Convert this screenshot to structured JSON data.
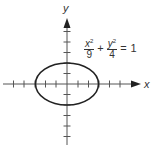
{
  "figure": {
    "axes": {
      "x_label": "x",
      "y_label": "y",
      "origin_px": [
        67,
        84
      ],
      "tick_spacing_px": 10.5,
      "x_ticks_count_each_side": 6,
      "y_ticks_count_up": 6,
      "y_ticks_count_down": 6
    },
    "curve": {
      "type": "ellipse",
      "semi_major_x": 3,
      "semi_minor_y": 2,
      "color": "#222222"
    },
    "equation": {
      "term1_numerator": "x",
      "term1_exponent": "2",
      "term1_denominator": "9",
      "plus": "+",
      "term2_numerator": "y",
      "term2_exponent": "2",
      "term2_denominator": "4",
      "equals": "=",
      "rhs": "1"
    },
    "colors": {
      "axis": "#555555",
      "text": "#333333",
      "background": "#ffffff"
    }
  }
}
